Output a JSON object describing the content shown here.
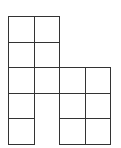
{
  "diagram": {
    "cell_size_px": 25.5,
    "origin_px": [
      8,
      16
    ],
    "line_color": "#333333",
    "cells": [
      {
        "row": 0,
        "col": 0
      },
      {
        "row": 0,
        "col": 1
      },
      {
        "row": 1,
        "col": 0
      },
      {
        "row": 1,
        "col": 1
      },
      {
        "row": 2,
        "col": 0
      },
      {
        "row": 2,
        "col": 1
      },
      {
        "row": 2,
        "col": 2
      },
      {
        "row": 2,
        "col": 3
      },
      {
        "row": 3,
        "col": 0
      },
      {
        "row": 3,
        "col": 2
      },
      {
        "row": 3,
        "col": 3
      },
      {
        "row": 4,
        "col": 0
      },
      {
        "row": 4,
        "col": 2
      },
      {
        "row": 4,
        "col": 3
      }
    ]
  }
}
